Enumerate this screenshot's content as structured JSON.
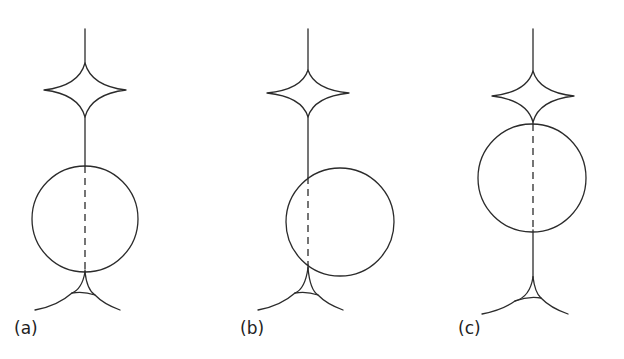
{
  "figure": {
    "line_color": "#2b2b2b",
    "background": "#ffffff",
    "panels": [
      {
        "label": "(a)",
        "label_pos": [
          14,
          318
        ],
        "axis_x": 85,
        "axis_top": 29,
        "astroid": {
          "cx": 85,
          "cy": 90,
          "rx": 41,
          "ry_top": 27,
          "ry_bottom": 27
        },
        "circle": {
          "cx": 85,
          "cy": 219,
          "r": 53
        },
        "dashed_from": 166,
        "dashed_to": 270,
        "lower_caustic": {
          "cusp": [
            85,
            272
          ],
          "left_end": [
            35,
            310
          ],
          "right_end": [
            120,
            310
          ],
          "chord_left": [
            72,
            293
          ],
          "chord_right": [
            95,
            295
          ]
        }
      },
      {
        "label": "(b)",
        "label_pos": [
          240,
          318
        ],
        "axis_x": 308,
        "axis_top": 29,
        "astroid": {
          "cx": 308,
          "cy": 93,
          "rx": 41,
          "ry_top": 23,
          "ry_bottom": 24
        },
        "circle": {
          "cx": 340,
          "cy": 222,
          "r": 54
        },
        "dashed_from": 177,
        "dashed_to": 265,
        "lower_caustic": {
          "cusp": [
            308,
            268
          ],
          "left_end": [
            258,
            310
          ],
          "right_end": [
            343,
            310
          ],
          "chord_left": [
            295,
            293
          ],
          "chord_right": [
            318,
            295
          ]
        }
      },
      {
        "label": "(c)",
        "label_pos": [
          458,
          318
        ],
        "axis_x": 533,
        "axis_top": 29,
        "astroid": {
          "cx": 533,
          "cy": 96,
          "rx": 41,
          "ry_top": 25,
          "ry_bottom": 26
        },
        "circle": {
          "cx": 532,
          "cy": 178,
          "r": 54
        },
        "dashed_from": 124,
        "dashed_to": 230,
        "lower_caustic": {
          "cusp": [
            533,
            277
          ],
          "left_end": [
            482,
            314
          ],
          "right_end": [
            568,
            314
          ],
          "chord_left": [
            515,
            301
          ],
          "chord_right": [
            541,
            298
          ]
        }
      }
    ]
  }
}
